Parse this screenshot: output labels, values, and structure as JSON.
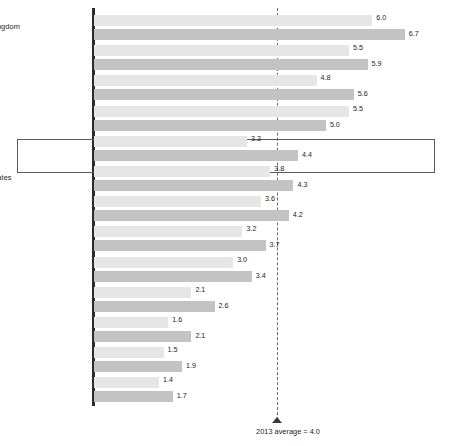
{
  "chart_data": {
    "type": "bar",
    "orientation": "horizontal",
    "title": "",
    "subtitle": "",
    "xlabel": "",
    "ylabel": "",
    "xlim": [
      0,
      7.2
    ],
    "grid": false,
    "legend_position": "none",
    "categories": [
      "United Kingdom",
      "Korea",
      "Japan",
      "Sweden",
      "China",
      "United States",
      "France",
      "Germany",
      "Canada",
      "Italy",
      "India",
      "Russia",
      "Brazil"
    ],
    "series": [
      {
        "name": "upper",
        "color": "#e6e6e6",
        "values": [
          6.0,
          5.5,
          4.8,
          5.5,
          3.3,
          3.8,
          3.6,
          3.2,
          3.0,
          2.1,
          1.6,
          1.5,
          1.4
        ]
      },
      {
        "name": "lower",
        "color": "#c3c3c3",
        "values": [
          6.7,
          5.9,
          5.6,
          5.0,
          4.4,
          4.3,
          4.2,
          3.7,
          3.4,
          2.6,
          2.1,
          1.9,
          1.7
        ]
      }
    ],
    "reference_line": {
      "value": 4.0,
      "style": "dashed",
      "color": "#6a6a6a",
      "caption": "2013 average = 4.0"
    },
    "highlighted_category": "China",
    "footnote_markers": {
      "China": "1"
    }
  },
  "rows": [
    {
      "label": "United Kingdom",
      "footnote": "",
      "top": "6.0",
      "bottom": "6.7"
    },
    {
      "label": "Korea",
      "footnote": "",
      "top": "5.5",
      "bottom": "5.9"
    },
    {
      "label": "Japan",
      "footnote": "",
      "top": "4.8",
      "bottom": "5.6"
    },
    {
      "label": "Sweden",
      "footnote": "",
      "top": "5.5",
      "bottom": "5.0"
    },
    {
      "label": "China",
      "footnote": "1",
      "top": "3.3",
      "bottom": "4.4"
    },
    {
      "label": "United States",
      "footnote": "",
      "top": "3.8",
      "bottom": "4.3"
    },
    {
      "label": "France",
      "footnote": "",
      "top": "3.6",
      "bottom": "4.2"
    },
    {
      "label": "Germany",
      "footnote": "",
      "top": "3.2",
      "bottom": "3.7"
    },
    {
      "label": "Canada",
      "footnote": "",
      "top": "3.0",
      "bottom": "3.4"
    },
    {
      "label": "Italy",
      "footnote": "",
      "top": "2.1",
      "bottom": "2.6"
    },
    {
      "label": "India",
      "footnote": "",
      "top": "1.6",
      "bottom": "2.1"
    },
    {
      "label": "Russia",
      "footnote": "",
      "top": "1.5",
      "bottom": "1.9"
    },
    {
      "label": "Brazil",
      "footnote": "",
      "top": "1.4",
      "bottom": "1.7"
    }
  ],
  "average": {
    "caption": "2013 average = 4.0"
  }
}
